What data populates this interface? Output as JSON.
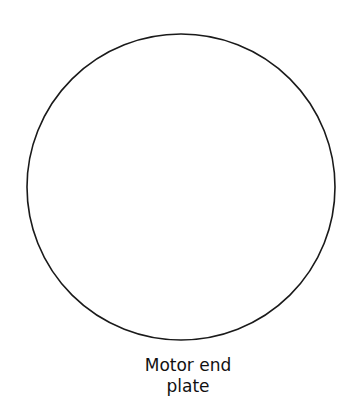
{
  "diagram": {
    "shape": {
      "type": "circle",
      "cx": 181,
      "cy": 187,
      "rx": 154,
      "ry": 153,
      "stroke": "#1a1a1a",
      "stroke_width": 1.6,
      "fill": "#ffffff"
    },
    "label": {
      "line1": "Motor end",
      "line2": "plate"
    }
  }
}
